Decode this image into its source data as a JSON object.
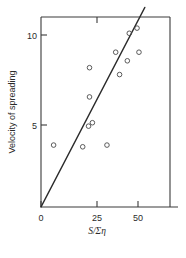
{
  "chart_data": {
    "type": "scatter",
    "title": "",
    "xlabel": "S/Ση",
    "ylabel": "Velocity of spreading",
    "xlim": [
      0,
      66
    ],
    "ylim": [
      0,
      11.6
    ],
    "xticks": [
      0,
      25,
      50
    ],
    "xticklabels": [
      "0",
      "25",
      "50"
    ],
    "yticks": [
      5,
      10
    ],
    "yticklabels": [
      "5",
      "10"
    ],
    "grid": false,
    "legend": null,
    "marker_style": "open-circle",
    "points": [
      {
        "x": 6.5,
        "y": 3.6
      },
      {
        "x": 21.5,
        "y": 3.5
      },
      {
        "x": 24.5,
        "y": 4.7
      },
      {
        "x": 26.5,
        "y": 4.9
      },
      {
        "x": 25.0,
        "y": 6.4
      },
      {
        "x": 25.0,
        "y": 8.1
      },
      {
        "x": 34.0,
        "y": 3.6
      },
      {
        "x": 38.5,
        "y": 9.0
      },
      {
        "x": 40.5,
        "y": 7.7
      },
      {
        "x": 44.5,
        "y": 8.5
      },
      {
        "x": 45.5,
        "y": 10.1
      },
      {
        "x": 49.5,
        "y": 10.4
      },
      {
        "x": 50.5,
        "y": 9.0
      }
    ],
    "fit_line": {
      "type": "linear-through-origin",
      "x_start": 0,
      "y_start": 0,
      "x_end": 53.5,
      "y_end": 11.6,
      "slope": 0.2168,
      "intercept": 0
    },
    "colors": {
      "axis": "#3a3a3a",
      "marker": "#4a4a4a",
      "line": "#2b2b2b",
      "background": "#ffffff"
    }
  }
}
